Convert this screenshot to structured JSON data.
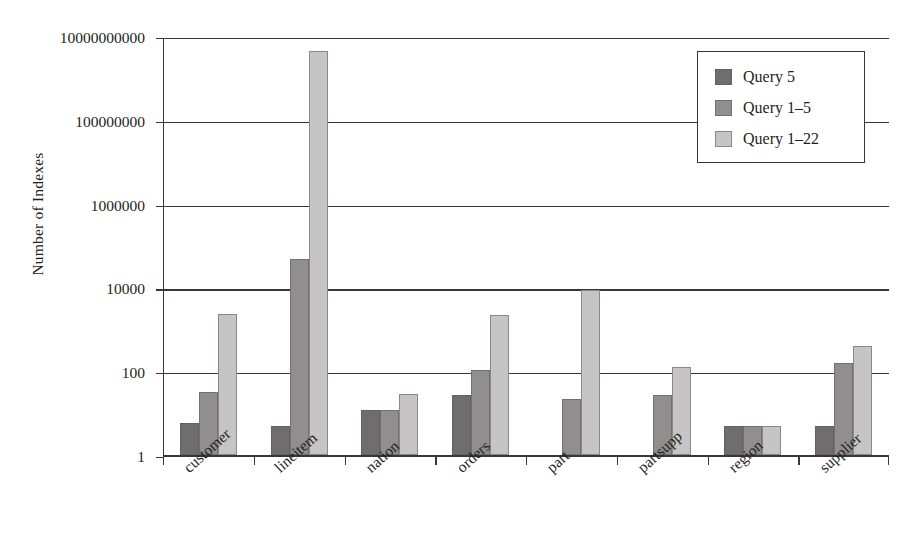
{
  "figure": {
    "caption_remnant": "",
    "ylabel": "Number of Indexes"
  },
  "legend": {
    "position": "top-right-inside",
    "items": [
      {
        "label": "Query 5",
        "color": "#6f6d6e"
      },
      {
        "label": "Query 1–5",
        "color": "#908e8f"
      },
      {
        "label": "Query 1–22",
        "color": "#c6c4c5"
      }
    ]
  },
  "chart_data": {
    "type": "bar",
    "title": "",
    "xlabel": "",
    "ylabel": "Number of Indexes",
    "yscale": "log",
    "ylim": [
      1,
      10000000000
    ],
    "ytick_labels": [
      "1",
      "100",
      "10000",
      "1000000",
      "100000000",
      "10000000000"
    ],
    "ytick_values": [
      1,
      100,
      10000,
      1000000,
      100000000,
      10000000000
    ],
    "grid": true,
    "legend_position": "upper right",
    "categories": [
      "customer",
      "lineitem",
      "nation",
      "orders",
      "part",
      "partsupp",
      "region",
      "supplier"
    ],
    "series": [
      {
        "name": "Query 5",
        "color": "#6f6d6e",
        "values": [
          6,
          5,
          12,
          28,
          0,
          0,
          5,
          5
        ]
      },
      {
        "name": "Query 1–5",
        "color": "#908e8f",
        "values": [
          32,
          50000,
          12,
          110,
          22,
          27,
          5,
          160
        ]
      },
      {
        "name": "Query 1–22",
        "color": "#c6c4c5",
        "values": [
          2400,
          4400000000,
          30,
          2200,
          9000,
          130,
          5,
          400
        ]
      }
    ]
  },
  "axis": {
    "ticks": [
      {
        "label": "10000000000",
        "value": 10000000000
      },
      {
        "label": "100000000",
        "value": 100000000
      },
      {
        "label": "1000000",
        "value": 1000000
      },
      {
        "label": "10000",
        "value": 10000
      },
      {
        "label": "100",
        "value": 100
      },
      {
        "label": "1",
        "value": 1
      }
    ]
  }
}
